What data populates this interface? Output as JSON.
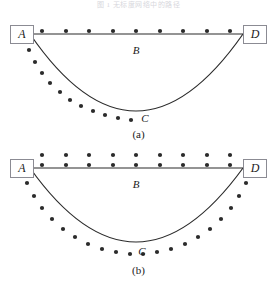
{
  "header": {
    "faint_text": "图 1 无标度网络中的路径"
  },
  "figure": {
    "nodes": {
      "a_label": "A",
      "d_label": "D"
    },
    "labels": {
      "b_label": "B",
      "c_label": "C"
    },
    "captions": {
      "a": "(a)",
      "b": "(b)"
    },
    "colors": {
      "line": "#2b2b2b",
      "dot": "#2b2b2b",
      "box_border": "#8b8b93",
      "background": "#ffffff",
      "text": "#1a1a1a"
    }
  },
  "chart_data": {
    "type": "diagram-scatter",
    "title": "",
    "xlabel": "",
    "ylabel": "",
    "panels": [
      {
        "name": "(a)",
        "endpoints": {
          "A": [
            30,
            24
          ],
          "D": [
            243,
            24
          ]
        },
        "straight_path_B": {
          "from": [
            30,
            24
          ],
          "to": [
            243,
            24
          ],
          "label": "B"
        },
        "curved_path_C": {
          "from": [
            30,
            24
          ],
          "to": [
            243,
            24
          ],
          "vertex": [
            136,
            101
          ],
          "label": "C",
          "label_pos": [
            143,
            108
          ]
        },
        "dot_rows": [
          {
            "name": "top-row-on-B",
            "count": 9,
            "points": [
              [
                42,
                21
              ],
              [
                66,
                21
              ],
              [
                89,
                21
              ],
              [
                113,
                21
              ],
              [
                136,
                21
              ],
              [
                160,
                21
              ],
              [
                183,
                21
              ],
              [
                207,
                21
              ],
              [
                230,
                21
              ]
            ]
          },
          {
            "name": "left-arc-dots",
            "count": 11,
            "points": [
              [
                29,
                40
              ],
              [
                35,
                52
              ],
              [
                42,
                63
              ],
              [
                50,
                73
              ],
              [
                60,
                82
              ],
              [
                70,
                90
              ],
              [
                81,
                96
              ],
              [
                93,
                101
              ],
              [
                105,
                105
              ],
              [
                118,
                108
              ],
              [
                131,
                110
              ]
            ]
          }
        ]
      },
      {
        "name": "(b)",
        "endpoints": {
          "A": [
            30,
            26
          ],
          "D": [
            243,
            26
          ]
        },
        "straight_path_B": {
          "from": [
            30,
            26
          ],
          "to": [
            243,
            26
          ],
          "label": "B"
        },
        "curved_path_C": {
          "from": [
            30,
            26
          ],
          "to": [
            243,
            26
          ],
          "vertex": [
            136,
            100
          ],
          "label": "C",
          "label_pos": [
            140,
            108
          ]
        },
        "dot_rows": [
          {
            "name": "top-row-upper",
            "count": 9,
            "points": [
              [
                42,
                13
              ],
              [
                66,
                13
              ],
              [
                89,
                13
              ],
              [
                113,
                13
              ],
              [
                136,
                13
              ],
              [
                160,
                13
              ],
              [
                183,
                13
              ],
              [
                207,
                13
              ],
              [
                230,
                13
              ]
            ]
          },
          {
            "name": "top-row-lower",
            "count": 9,
            "points": [
              [
                42,
                23
              ],
              [
                66,
                23
              ],
              [
                89,
                23
              ],
              [
                113,
                23
              ],
              [
                136,
                23
              ],
              [
                160,
                23
              ],
              [
                183,
                23
              ],
              [
                207,
                23
              ],
              [
                230,
                23
              ]
            ]
          },
          {
            "name": "left-arc-dots",
            "count": 10,
            "points": [
              [
                27,
                41
              ],
              [
                34,
                54
              ],
              [
                42,
                66
              ],
              [
                52,
                77
              ],
              [
                63,
                87
              ],
              [
                75,
                95
              ],
              [
                88,
                102
              ],
              [
                102,
                107
              ],
              [
                116,
                110
              ],
              [
                130,
                112
              ]
            ]
          },
          {
            "name": "right-arc-dots",
            "count": 10,
            "points": [
              [
                246,
                41
              ],
              [
                239,
                54
              ],
              [
                231,
                66
              ],
              [
                221,
                77
              ],
              [
                210,
                87
              ],
              [
                198,
                95
              ],
              [
                185,
                102
              ],
              [
                171,
                107
              ],
              [
                157,
                110
              ],
              [
                143,
                112
              ]
            ]
          }
        ]
      }
    ]
  }
}
